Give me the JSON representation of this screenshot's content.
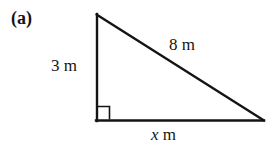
{
  "figure": {
    "part_label": "(a)",
    "shape": "right-triangle",
    "stroke_color": "#141414",
    "background_color": "#ffffff",
    "stroke_width": 2,
    "vertices": {
      "apex": [
        96,
        14
      ],
      "bottom_left": [
        96,
        121
      ],
      "bottom_right": [
        264,
        121
      ]
    },
    "right_angle_marker": {
      "at": "bottom_left",
      "size": 13
    },
    "labels": {
      "vertical_side": {
        "value": "3",
        "unit": "m",
        "full": "3 m"
      },
      "hypotenuse": {
        "value": "8",
        "unit": "m",
        "full": "8 m"
      },
      "base": {
        "value": "x",
        "unit": "m",
        "full": "x m",
        "italic_value": true
      }
    }
  }
}
